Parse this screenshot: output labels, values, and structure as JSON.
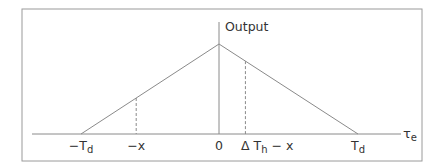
{
  "diagram": {
    "type": "triangular-response",
    "y_axis_label": "Output",
    "x_axis_label": {
      "main": "τ",
      "sub": "e"
    },
    "peak": {
      "x": 0,
      "relative_height": 1.0
    },
    "x_ticks": [
      {
        "id": "neg-td",
        "prefix": "−T",
        "sub": "d",
        "suffix": "",
        "value": -1.0
      },
      {
        "id": "neg-x",
        "prefix": "−x",
        "sub": "",
        "suffix": "",
        "value": -0.6
      },
      {
        "id": "zero",
        "prefix": "0",
        "sub": "",
        "suffix": "",
        "value": 0.0
      },
      {
        "id": "delta-th-minus-x",
        "prefix": "Δ T",
        "sub": "h",
        "suffix": " − x",
        "value": 0.19
      },
      {
        "id": "pos-td",
        "prefix": "T",
        "sub": "d",
        "suffix": "",
        "value": 1.0
      }
    ],
    "dashed_markers": [
      {
        "at": "neg-x",
        "value": -0.6
      },
      {
        "at": "delta-th-minus-x",
        "value": 0.19
      }
    ],
    "colors": {
      "frame": "#9a9a9a",
      "lines": "#8a8a8a",
      "text": "#333333"
    }
  }
}
